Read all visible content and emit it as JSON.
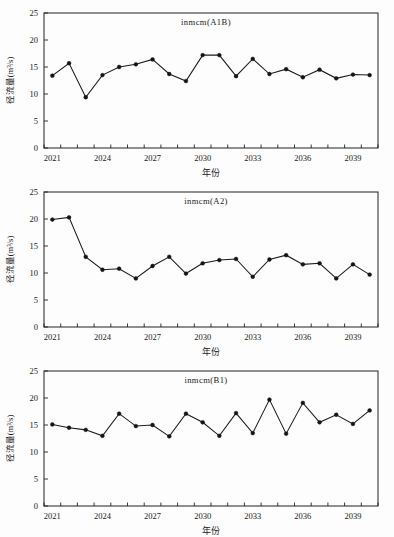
{
  "figure": {
    "background": "#fdfdfd",
    "line_color": "#1b1b1b",
    "marker_color": "#141414",
    "axis_color": "#222222"
  },
  "axis_titles": {
    "x": "年份",
    "y": "径流量(m³/s)"
  },
  "y_ticks": [
    "0",
    "5",
    "10",
    "15",
    "20",
    "25"
  ],
  "x_tick_labels": [
    "2021",
    "2024",
    "2027",
    "2030",
    "2033",
    "2036",
    "2039"
  ],
  "chart_data": [
    {
      "type": "line",
      "title": "inmcm(A1B)",
      "xlabel": "年份",
      "ylabel": "径流量(m³/s)",
      "ylim": [
        0,
        25
      ],
      "xlim": [
        2021,
        2041
      ],
      "grid": false,
      "legend": "none",
      "x": [
        2021,
        2022,
        2023,
        2024,
        2025,
        2026,
        2027,
        2028,
        2029,
        2030,
        2031,
        2032,
        2033,
        2034,
        2035,
        2036,
        2037,
        2038,
        2039,
        2040
      ],
      "values": [
        13.4,
        15.7,
        9.4,
        13.5,
        15.0,
        15.5,
        16.4,
        13.7,
        12.4,
        17.2,
        17.2,
        13.3,
        16.5,
        13.7,
        14.6,
        13.1,
        14.5,
        12.9,
        13.6,
        13.5
      ]
    },
    {
      "type": "line",
      "title": "inmcm(A2)",
      "xlabel": "年份",
      "ylabel": "径流量(m³/s)",
      "ylim": [
        0,
        25
      ],
      "xlim": [
        2021,
        2041
      ],
      "grid": false,
      "legend": "none",
      "x": [
        2021,
        2022,
        2023,
        2024,
        2025,
        2026,
        2027,
        2028,
        2029,
        2030,
        2031,
        2032,
        2033,
        2034,
        2035,
        2036,
        2037,
        2038,
        2039,
        2040
      ],
      "values": [
        19.9,
        20.3,
        13.0,
        10.6,
        10.8,
        9.0,
        11.3,
        13.0,
        9.9,
        11.8,
        12.4,
        12.6,
        9.3,
        12.5,
        13.3,
        11.6,
        11.8,
        9.0,
        11.6,
        9.7
      ]
    },
    {
      "type": "line",
      "title": "inmcm(B1)",
      "xlabel": "年份",
      "ylabel": "径流量(m³/s)",
      "ylim": [
        0,
        25
      ],
      "xlim": [
        2021,
        2041
      ],
      "grid": false,
      "legend": "none",
      "x": [
        2021,
        2022,
        2023,
        2024,
        2025,
        2026,
        2027,
        2028,
        2029,
        2030,
        2031,
        2032,
        2033,
        2034,
        2035,
        2036,
        2037,
        2038,
        2039,
        2040
      ],
      "values": [
        15.1,
        14.5,
        14.1,
        13.0,
        17.1,
        14.8,
        15.0,
        12.9,
        17.1,
        15.5,
        13.0,
        17.2,
        13.5,
        19.7,
        13.4,
        19.1,
        15.5,
        16.9,
        15.2,
        17.7
      ]
    }
  ]
}
